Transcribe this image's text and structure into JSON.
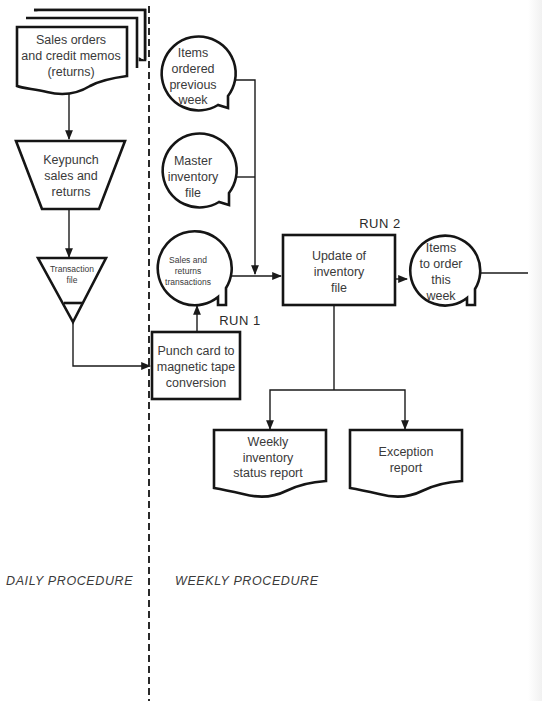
{
  "diagram": {
    "type": "system flowchart",
    "sections": {
      "daily": "DAILY PROCEDURE",
      "weekly": "WEEKLY PROCEDURE"
    },
    "runs": {
      "run1": "RUN 1",
      "run2": "RUN 2"
    },
    "nodes": {
      "sales_docs": {
        "shape": "multi-document",
        "lines": [
          "Sales orders",
          "and credit memos",
          "(returns)"
        ]
      },
      "keypunch": {
        "shape": "manual-operation",
        "lines": [
          "Keypunch",
          "sales and",
          "returns"
        ]
      },
      "transaction_file": {
        "shape": "offline-storage",
        "lines": [
          "Transaction",
          "file"
        ]
      },
      "punch_to_tape": {
        "shape": "process",
        "lines": [
          "Punch card to",
          "magnetic tape",
          "conversion"
        ]
      },
      "sales_returns_tx": {
        "shape": "magnetic-tape",
        "lines": [
          "Sales and",
          "returns",
          "transactions"
        ]
      },
      "items_prev_week": {
        "shape": "magnetic-tape",
        "lines": [
          "Items",
          "ordered",
          "previous",
          "week"
        ]
      },
      "master_inventory": {
        "shape": "magnetic-tape",
        "lines": [
          "Master",
          "inventory",
          "file"
        ]
      },
      "update_inventory": {
        "shape": "process",
        "lines": [
          "Update of",
          "inventory",
          "file"
        ]
      },
      "items_to_order": {
        "shape": "magnetic-tape",
        "lines": [
          "Items",
          "to order",
          "this",
          "week"
        ]
      },
      "weekly_status_report": {
        "shape": "document",
        "lines": [
          "Weekly",
          "inventory",
          "status report"
        ]
      },
      "exception_report": {
        "shape": "document",
        "lines": [
          "Exception",
          "report"
        ]
      }
    },
    "edges": [
      {
        "from": "sales_docs",
        "to": "keypunch"
      },
      {
        "from": "keypunch",
        "to": "transaction_file"
      },
      {
        "from": "transaction_file",
        "to": "punch_to_tape"
      },
      {
        "from": "punch_to_tape",
        "to": "sales_returns_tx"
      },
      {
        "from": "sales_returns_tx",
        "to": "update_inventory"
      },
      {
        "from": "items_prev_week",
        "to": "update_inventory"
      },
      {
        "from": "master_inventory",
        "to": "update_inventory"
      },
      {
        "from": "update_inventory",
        "to": "items_to_order"
      },
      {
        "from": "update_inventory",
        "to": "weekly_status_report"
      },
      {
        "from": "update_inventory",
        "to": "exception_report"
      }
    ]
  }
}
